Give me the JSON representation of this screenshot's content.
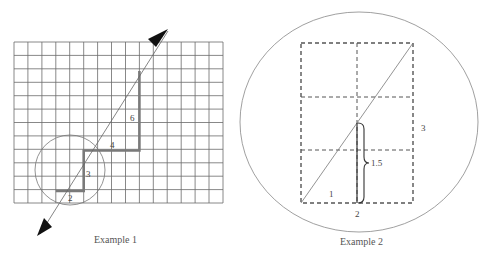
{
  "example1": {
    "caption": "Example 1",
    "grid": {
      "x": 14,
      "y": 42,
      "cols": 15,
      "rows": 12,
      "cell_w": 13.93,
      "cell_h": 13.42,
      "line_color": "#6a6a6a"
    },
    "step_labels": [
      "2",
      "3",
      "4",
      "6"
    ],
    "step_color": "#7a7a7a",
    "circle": {
      "cx": 70,
      "cy": 170,
      "r": 35
    }
  },
  "example2": {
    "caption": "Example 2",
    "labels": {
      "bottom_segment": "1",
      "bottom_width": "2",
      "right_height": "3",
      "brace_value": "1.5"
    },
    "outer_ellipse": {
      "cx": 359,
      "cy": 122,
      "rx": 119,
      "ry": 110
    }
  }
}
